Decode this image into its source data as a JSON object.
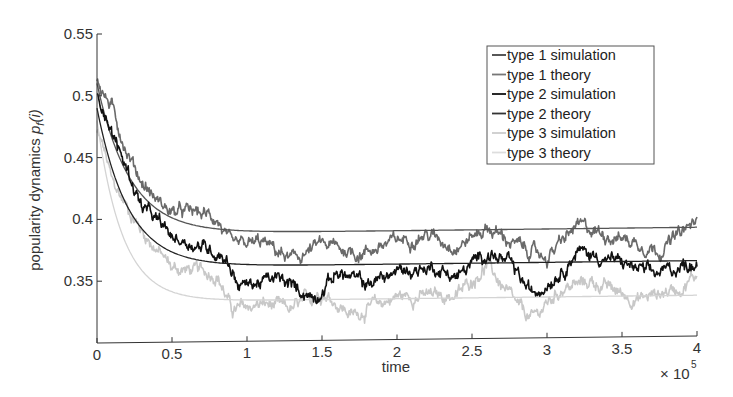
{
  "chart_data": {
    "type": "line",
    "title": "",
    "xlabel": "time",
    "ylabel": "popularity dynamics p_f(i)",
    "ylabel_parts": {
      "main": "popularity dynamics ",
      "var": "p",
      "sub": "f",
      "arg": "(i)"
    },
    "x_multiplier": "× 10",
    "x_multiplier_exp": "5",
    "xlim": [
      0,
      4
    ],
    "ylim": [
      0.3,
      0.55
    ],
    "xticks": [
      0,
      0.5,
      1,
      1.5,
      2,
      2.5,
      3,
      3.5,
      4
    ],
    "xtick_labels": [
      "0",
      "0.5",
      "1",
      "1.5",
      "2",
      "2.5",
      "3",
      "3.5",
      "4"
    ],
    "yticks": [
      0.35,
      0.4,
      0.45,
      0.5,
      0.55
    ],
    "ytick_labels": [
      "0.35",
      "0.4",
      "0.45",
      "0.5",
      "0.55"
    ],
    "grid": false,
    "legend_position": "upper right",
    "series": [
      {
        "name": "type 1 simulation",
        "kind": "simulation",
        "color": "#6a6a6a",
        "legend_color": "#444444",
        "width": 1.6,
        "x": [
          0,
          0.05,
          0.1,
          0.2,
          0.3,
          0.4,
          0.5,
          0.65,
          0.8,
          0.9,
          1.1,
          1.3,
          1.5,
          1.75,
          2.0,
          2.2,
          2.4,
          2.6,
          2.8,
          3.0,
          3.2,
          3.5,
          3.75,
          4.0
        ],
        "y": [
          0.515,
          0.5,
          0.49,
          0.455,
          0.43,
          0.415,
          0.405,
          0.405,
          0.4,
          0.375,
          0.38,
          0.365,
          0.378,
          0.37,
          0.38,
          0.385,
          0.375,
          0.39,
          0.375,
          0.365,
          0.39,
          0.38,
          0.37,
          0.393
        ]
      },
      {
        "name": "type 1 theory",
        "kind": "theory",
        "color": "#555555",
        "legend_color": "#777777",
        "width": 1.3,
        "start": 0.51,
        "end": 0.388,
        "tau": 0.22
      },
      {
        "name": "type 2 simulation",
        "kind": "simulation",
        "color": "#111111",
        "legend_color": "#111111",
        "width": 1.6,
        "x": [
          0,
          0.05,
          0.1,
          0.3,
          0.5,
          0.75,
          0.85,
          0.95,
          1.2,
          1.45,
          1.6,
          1.8,
          2.0,
          2.25,
          2.4,
          2.6,
          2.75,
          2.9,
          3.1,
          3.2,
          3.5,
          3.7,
          4.0
        ],
        "y": [
          0.5,
          0.49,
          0.47,
          0.41,
          0.385,
          0.375,
          0.37,
          0.345,
          0.35,
          0.335,
          0.355,
          0.345,
          0.355,
          0.358,
          0.35,
          0.37,
          0.36,
          0.335,
          0.355,
          0.37,
          0.36,
          0.35,
          0.36
        ]
      },
      {
        "name": "type 2 theory",
        "kind": "theory",
        "color": "#222222",
        "legend_color": "#333333",
        "width": 1.3,
        "start": 0.49,
        "end": 0.361,
        "tau": 0.21
      },
      {
        "name": "type 3 simulation",
        "kind": "simulation",
        "color": "#c8c8c8",
        "legend_color": "#cccccc",
        "width": 1.6,
        "x": [
          0,
          0.05,
          0.1,
          0.3,
          0.5,
          0.8,
          0.9,
          1.1,
          1.3,
          1.5,
          1.7,
          2.0,
          2.4,
          2.6,
          2.8,
          2.9,
          3.1,
          3.3,
          3.6,
          3.9,
          4.0
        ],
        "y": [
          0.47,
          0.455,
          0.43,
          0.39,
          0.36,
          0.355,
          0.325,
          0.33,
          0.325,
          0.34,
          0.32,
          0.335,
          0.335,
          0.36,
          0.325,
          0.315,
          0.34,
          0.345,
          0.33,
          0.34,
          0.35
        ]
      },
      {
        "name": "type 3 theory",
        "kind": "theory",
        "color": "#d4d4d4",
        "legend_color": "#dddddd",
        "width": 1.3,
        "start": 0.48,
        "end": 0.333,
        "tau": 0.17
      }
    ]
  }
}
